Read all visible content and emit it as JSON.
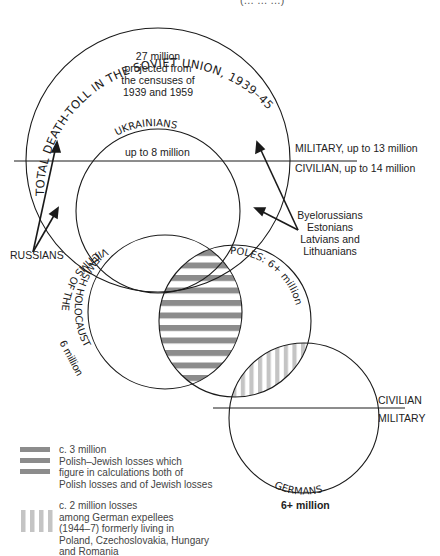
{
  "header": {
    "cut_off_caption": "(… … …)"
  },
  "soviet": {
    "arc_title": "TOTAL DEATH-TOLL IN THE SOVIET UNION, 1939–45",
    "summary": [
      "27 million",
      "projected from",
      "the censuses of",
      "1939 and 1959"
    ],
    "military": "MILITARY, up to 13 million",
    "civilian": "CIVILIAN, up to 14 million"
  },
  "ukrainians": {
    "arc_label": "UKRAINIANS",
    "value": "up to 8 million"
  },
  "russians": {
    "label": "RUSSIANS"
  },
  "baltic": {
    "lines": [
      "Byelorussians",
      "Estonians",
      "Latvians and",
      "Lithuanians"
    ]
  },
  "jews": {
    "arc_label": "VICTIMS OF THE",
    "arc_label2": "JEWISH HOLOCAUST",
    "value": "6 million"
  },
  "poles": {
    "arc_label": "POLES: 6+ million"
  },
  "germans": {
    "arc_label": "GERMANS",
    "value": "6+ million",
    "civilian": "CIVILIAN",
    "military": "MILITARY"
  },
  "legend": [
    {
      "pattern": "horizontal-stripes",
      "color": "#8c8c8c",
      "lines": [
        "c. 3 million",
        "Polish–Jewish losses which",
        "figure in calculations both of",
        "Polish losses and of Jewish losses"
      ]
    },
    {
      "pattern": "vertical-stripes",
      "color": "#c4c4c4",
      "lines": [
        "c. 2 million losses",
        "among German expellees",
        "(1944–7) formerly living in",
        "Poland, Czechoslovakia, Hungary",
        "and Romania"
      ]
    }
  ],
  "colors": {
    "line": "#1a1a1a",
    "polish_jewish_stripe": "#8c8c8c",
    "expellee_stripe": "#c4c4c4"
  }
}
